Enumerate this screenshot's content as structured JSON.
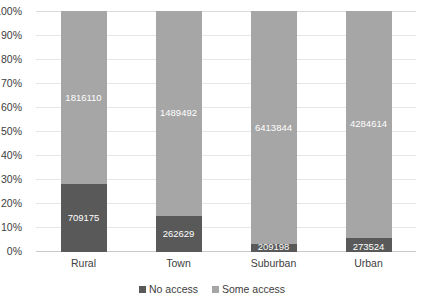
{
  "chart_data": {
    "type": "bar",
    "subtype": "100% stacked bar",
    "title": "",
    "xlabel": "",
    "ylabel": "",
    "ylim": [
      0,
      100
    ],
    "grid": true,
    "legend_position": "bottom-center",
    "categories": [
      "Rural",
      "Town",
      "Suburban",
      "Urban"
    ],
    "ytick_labels": [
      "100%",
      "90%",
      "80%",
      "70%",
      "60%",
      "50%",
      "40%",
      "30%",
      "20%",
      "10%",
      "0%"
    ],
    "ytick_values": [
      100,
      90,
      80,
      70,
      60,
      50,
      40,
      30,
      20,
      10,
      0
    ],
    "series": [
      {
        "name": "No access",
        "color": "#595959",
        "values": [
          709175,
          262629,
          209198,
          273524
        ],
        "labels": [
          "709175",
          "262629",
          "209198",
          "273524"
        ],
        "percent": [
          28.1,
          15.0,
          3.2,
          6.0
        ]
      },
      {
        "name": "Some access",
        "color": "#a6a6a6",
        "values": [
          1816110,
          1489492,
          6413844,
          4284614
        ],
        "labels": [
          "1816110",
          "1489492",
          "6413844",
          "4284614"
        ],
        "percent": [
          71.9,
          85.0,
          96.8,
          94.0
        ]
      }
    ]
  },
  "legend": {
    "items": [
      {
        "label": "No access",
        "color": "#595959"
      },
      {
        "label": "Some access",
        "color": "#a6a6a6"
      }
    ]
  }
}
